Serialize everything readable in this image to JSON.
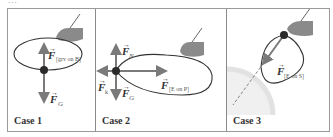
{
  "figure": {
    "cropped_header": "...",
    "panels": [
      {
        "label": "Case 1",
        "forces": [
          {
            "name": "F",
            "subscript": "[grv on B]",
            "direction": "up"
          },
          {
            "name": "F",
            "subscript": "G",
            "direction": "down"
          }
        ]
      },
      {
        "label": "Case 2",
        "forces": [
          {
            "name": "F",
            "subscript": "N",
            "direction": "up"
          },
          {
            "name": "F",
            "subscript": "k",
            "direction": "left"
          },
          {
            "name": "F",
            "subscript": "G",
            "direction": "down"
          },
          {
            "name": "F",
            "subscript": "[E on P]",
            "direction": "right"
          }
        ]
      },
      {
        "label": "Case 3",
        "forces": [
          {
            "name": "F",
            "subscript": "[E on S]",
            "direction": "down-left"
          }
        ]
      }
    ]
  },
  "colors": {
    "arrow": "#7a7a7a",
    "loop": "#333333",
    "ball": "#2a2a2a",
    "hand": "#8a8a8a",
    "frame": "#9a9a9a"
  }
}
